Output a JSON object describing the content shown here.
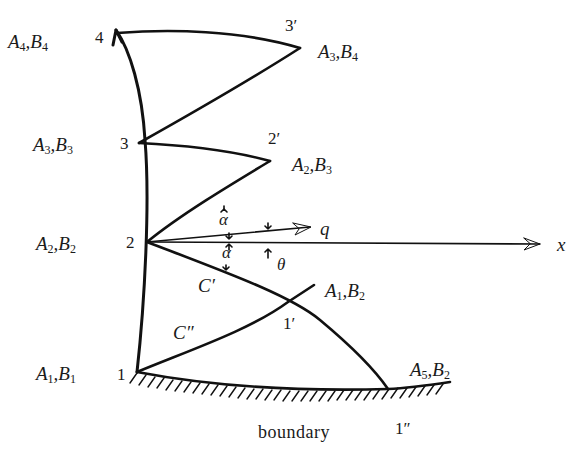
{
  "diagram": {
    "type": "characteristics-net",
    "axis_label": "x",
    "ray_label": "q",
    "angle_labels": {
      "alpha_upper": "α",
      "alpha_lower": "α",
      "theta": "θ"
    },
    "boundary_label": "boundary",
    "curve_labels": {
      "c_prime": "C′",
      "c_double_prime": "C″"
    },
    "wall_points": [
      {
        "id": "1",
        "label": "A",
        "sub1": "1",
        "sep": ",",
        "label2": "B",
        "sub2": "1"
      },
      {
        "id": "2",
        "label": "A",
        "sub1": "2",
        "sep": ",",
        "label2": "B",
        "sub2": "2"
      },
      {
        "id": "3",
        "label": "A",
        "sub1": "3",
        "sep": ",",
        "label2": "B",
        "sub2": "3"
      },
      {
        "id": "4",
        "label": "A",
        "sub1": "4",
        "sep": ",",
        "label2": "B",
        "sub2": "4"
      }
    ],
    "outer_points": [
      {
        "id": "3′",
        "label": "A",
        "sub1": "3",
        "sep": ",",
        "label2": "B",
        "sub2": "4"
      },
      {
        "id": "2′",
        "label": "A",
        "sub1": "2",
        "sep": ",",
        "label2": "B",
        "sub2": "3"
      },
      {
        "id": "1′",
        "label": "A",
        "sub1": "1",
        "sep": ",",
        "label2": "B",
        "sub2": "2"
      },
      {
        "id": "1″",
        "label": "A",
        "sub1": "5",
        "sep": ",",
        "label2": "B",
        "sub2": "2"
      }
    ]
  }
}
